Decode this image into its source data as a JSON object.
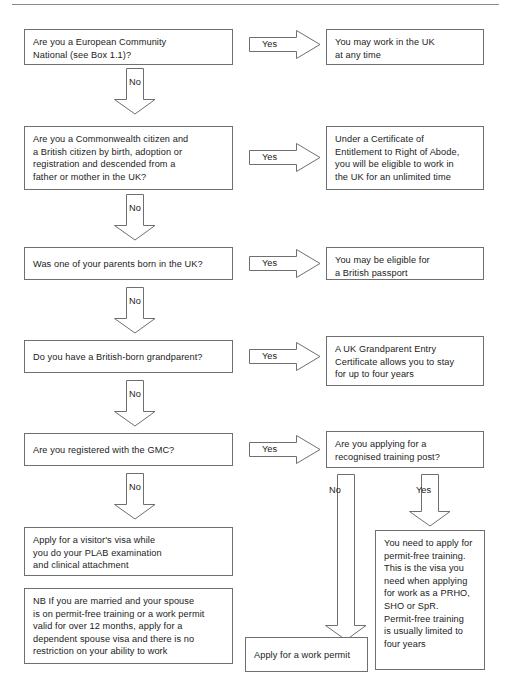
{
  "document": {
    "type": "decision-flowchart",
    "title": "UK work eligibility decision flowchart"
  },
  "labels": {
    "yes": "Yes",
    "no": "No"
  },
  "nodes": {
    "q_ec_national": "Are you a European Community\nNational (see Box 1.1)?",
    "r_work_uk_anytime": "You may work in the UK\nat any time",
    "q_commonwealth": "Are you a Commonwealth citizen and\na British citizen by birth, adoption or\nregistration and descended from a\nfather or mother in the UK?",
    "r_right_of_abode": "Under a Certificate of\nEntitlement to Right of Abode,\nyou will be eligible to work in\nthe UK for an unlimited time",
    "q_parent_born_uk": "Was one of your parents born in the UK?",
    "r_british_passport": "You may be eligible for\na British passport",
    "q_grandparent": "Do you have a British-born grandparent?",
    "r_grandparent_entry": "A UK Grandparent Entry\nCertificate allows you to stay\nfor up to four years",
    "q_gmc": "Are you registered with the GMC?",
    "q_training_post": "Are you applying for a\nrecognised training post?",
    "r_visitors_visa": "Apply for a visitor's visa while\nyou do your PLAB examination\nand clinical attachment",
    "r_nb_spouse": "NB If you are married and your spouse\nis on permit-free training or a work permit\nvalid for over 12 months, apply for a\ndependent spouse visa and there is no\nrestriction on your ability to work",
    "r_work_permit": "Apply for a work permit",
    "r_permit_free_training": "You need to apply for\npermit-free training.\nThis is the visa you\nneed when applying\nfor work as a PRHO,\nSHO or SpR.\nPermit-free training\nis usually limited to\nfour years"
  },
  "colors": {
    "stroke": "#6f6f6f",
    "text": "#1b1b1b",
    "background": "#ffffff",
    "rule": "#8a8a8a"
  }
}
